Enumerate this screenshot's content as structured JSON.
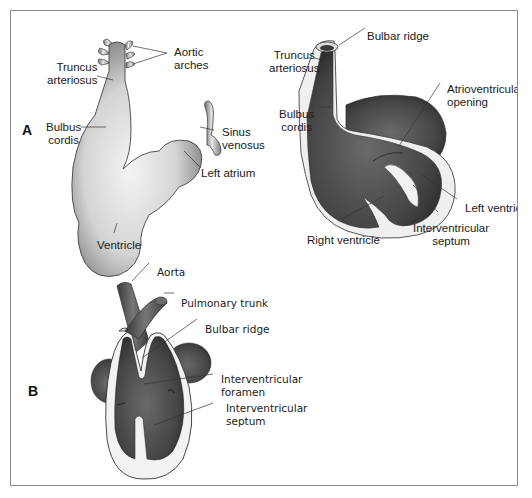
{
  "figure": {
    "panels": [
      {
        "letter": "A",
        "left_heart": {
          "labels": {
            "truncus_arteriosus": "Truncus\narteriosus",
            "aortic_arches": "Aortic\narches",
            "bulbus_cordis": "Bulbus\ncordis",
            "sinus_venosus": "Sinus\nvenosus",
            "left_atrium": "Left atrium",
            "ventricle": "Ventricle"
          }
        },
        "right_heart": {
          "labels": {
            "bulbar_ridge": "Bulbar ridge",
            "truncus_arteriosus": "Truncus\narteriosus",
            "atrioventricular_opening": "Atrioventricular\nopening",
            "bulbus_cordis": "Bulbus\ncordis",
            "left_ventricle": "Left ventric",
            "right_ventricle": "Right ventricle",
            "interventricular_septum": "Interventricular\nseptum"
          }
        }
      },
      {
        "letter": "B",
        "heart": {
          "labels": {
            "aorta": "Aorta",
            "pulmonary_trunk": "Pulmonary trunk",
            "bulbar_ridge": "Bulbar ridge",
            "interventricular_foramen": "Interventricular\nforamen",
            "interventricular_septum": "Interventricular\nseptum"
          }
        }
      }
    ],
    "colors": {
      "border": "#8a8a8a",
      "tissue_light": "#e6e6e6",
      "tissue_dark": "#5a5a5a",
      "cavity": "#3e3e3e",
      "wall_cut": "#f2f2f2",
      "leader_line": "#333333"
    }
  }
}
